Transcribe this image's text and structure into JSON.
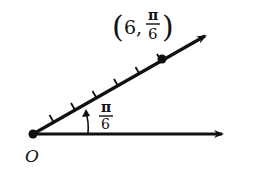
{
  "diagram": {
    "type": "polar-coordinate-point",
    "origin_label": "O",
    "angle_label": {
      "numerator": "π",
      "denominator": "6"
    },
    "point_label": {
      "open": "(",
      "r": "6",
      "comma": ",",
      "theta_num": "π",
      "theta_den": "6",
      "close": ")"
    },
    "polar_point": {
      "r": 6,
      "theta": "π/6"
    },
    "tick_count": 6,
    "colors": {
      "stroke": "#111111",
      "background": "#ffffff"
    }
  }
}
